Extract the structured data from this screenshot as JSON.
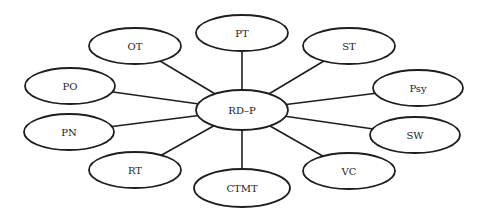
{
  "diagram": {
    "type": "hub-and-spoke",
    "center": {
      "id": "RD-P",
      "label": "RD–P"
    },
    "nodes": [
      {
        "id": "OT",
        "label": "OT"
      },
      {
        "id": "PT",
        "label": "PT"
      },
      {
        "id": "ST",
        "label": "ST"
      },
      {
        "id": "Psy",
        "label": "Psy"
      },
      {
        "id": "SW",
        "label": "SW"
      },
      {
        "id": "VC",
        "label": "VC"
      },
      {
        "id": "CTMT",
        "label": "CTMT"
      },
      {
        "id": "RT",
        "label": "RT"
      },
      {
        "id": "PN",
        "label": "PN"
      },
      {
        "id": "PO",
        "label": "PO"
      }
    ],
    "edges": [
      [
        "RD-P",
        "OT"
      ],
      [
        "RD-P",
        "PT"
      ],
      [
        "RD-P",
        "ST"
      ],
      [
        "RD-P",
        "Psy"
      ],
      [
        "RD-P",
        "SW"
      ],
      [
        "RD-P",
        "VC"
      ],
      [
        "RD-P",
        "CTMT"
      ],
      [
        "RD-P",
        "RT"
      ],
      [
        "RD-P",
        "PN"
      ],
      [
        "RD-P",
        "PO"
      ]
    ]
  }
}
